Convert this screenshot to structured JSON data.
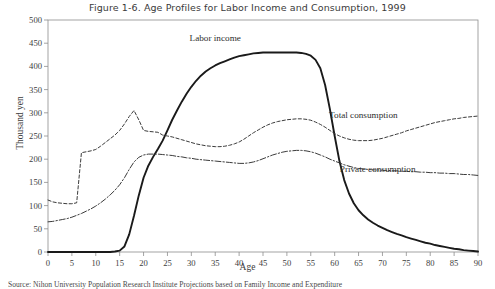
{
  "figure": {
    "title": "Figure 1-6. Age Profiles for Labor Income and Consumption, 1999",
    "source": "Source: Nihon University Population Research Institute Projections based on Family Income and Expenditure"
  },
  "chart_data": {
    "type": "line",
    "title": "Figure 1-6. Age Profiles for Labor Income and Consumption, 1999",
    "xlabel": "Age",
    "ylabel": "Thousand yen",
    "xlim": [
      0,
      90
    ],
    "ylim": [
      0,
      500
    ],
    "xticks": [
      0,
      5,
      10,
      15,
      20,
      25,
      30,
      35,
      40,
      45,
      50,
      55,
      60,
      65,
      70,
      75,
      80,
      85,
      90
    ],
    "yticks": [
      0,
      50,
      100,
      150,
      200,
      250,
      300,
      350,
      400,
      450,
      500
    ],
    "grid": false,
    "legend_position": "inline-annotations",
    "x": [
      0,
      1,
      2,
      3,
      4,
      5,
      6,
      7,
      8,
      9,
      10,
      11,
      12,
      13,
      14,
      15,
      16,
      17,
      18,
      19,
      20,
      21,
      22,
      23,
      24,
      25,
      26,
      27,
      28,
      29,
      30,
      31,
      32,
      33,
      34,
      35,
      36,
      37,
      38,
      39,
      40,
      41,
      42,
      43,
      44,
      45,
      46,
      47,
      48,
      49,
      50,
      51,
      52,
      53,
      54,
      55,
      56,
      57,
      58,
      59,
      60,
      61,
      62,
      63,
      64,
      65,
      66,
      67,
      68,
      69,
      70,
      71,
      72,
      73,
      74,
      75,
      76,
      77,
      78,
      79,
      80,
      81,
      82,
      83,
      84,
      85,
      86,
      87,
      88,
      89,
      90
    ],
    "series": [
      {
        "name": "Labor income",
        "style": "solid",
        "color": "#1a1a1a",
        "annotation": "Labor income",
        "annotation_x": 35,
        "annotation_y": 455,
        "values": [
          0,
          0,
          0,
          0,
          0,
          0,
          0,
          0,
          0,
          0,
          0,
          0,
          0,
          0,
          1,
          3,
          12,
          38,
          78,
          122,
          160,
          186,
          205,
          222,
          240,
          262,
          285,
          305,
          324,
          341,
          356,
          369,
          380,
          389,
          396,
          402,
          407,
          411,
          415,
          419,
          422,
          424,
          426,
          428,
          429,
          430,
          430,
          430,
          430,
          430,
          430,
          430,
          430,
          429,
          427,
          423,
          414,
          396,
          360,
          308,
          250,
          196,
          155,
          126,
          105,
          90,
          79,
          70,
          63,
          57,
          52,
          47,
          43,
          39,
          36,
          32,
          29,
          26,
          23,
          20,
          18,
          15,
          13,
          11,
          9,
          7,
          6,
          4,
          3,
          2,
          1
        ]
      },
      {
        "name": "Total consumption",
        "style": "dashed",
        "color": "#3b3b3b",
        "annotation": "Total consumption",
        "annotation_x": 66,
        "annotation_y": 289,
        "values": [
          112,
          108,
          106,
          105,
          104,
          104,
          106,
          214,
          216,
          218,
          221,
          228,
          236,
          244,
          252,
          262,
          276,
          292,
          305,
          285,
          262,
          260,
          259,
          258,
          252,
          250,
          248,
          245,
          242,
          239,
          236,
          233,
          231,
          229,
          228,
          227,
          227,
          228,
          230,
          233,
          237,
          243,
          250,
          257,
          263,
          269,
          274,
          278,
          281,
          283,
          285,
          286,
          287,
          287,
          286,
          284,
          280,
          275,
          269,
          262,
          255,
          250,
          246,
          243,
          241,
          240,
          240,
          240,
          241,
          243,
          245,
          248,
          251,
          254,
          257,
          261,
          264,
          267,
          270,
          273,
          276,
          279,
          281,
          283,
          285,
          287,
          288,
          290,
          291,
          292,
          293
        ]
      },
      {
        "name": "Private consumption",
        "style": "dashdot",
        "color": "#3b3b3b",
        "annotation": "Private consumption",
        "annotation_x": 69,
        "annotation_y": 172,
        "values": [
          65,
          66,
          68,
          70,
          72,
          75,
          79,
          83,
          88,
          93,
          99,
          106,
          114,
          123,
          133,
          145,
          160,
          178,
          194,
          204,
          209,
          211,
          211,
          211,
          210,
          209,
          208,
          206,
          205,
          203,
          202,
          200,
          199,
          198,
          197,
          196,
          195,
          194,
          193,
          192,
          191,
          191,
          192,
          194,
          197,
          201,
          205,
          209,
          212,
          215,
          217,
          218,
          219,
          219,
          218,
          216,
          213,
          209,
          205,
          200,
          196,
          192,
          188,
          185,
          182,
          180,
          179,
          178,
          177,
          177,
          176,
          176,
          175,
          175,
          174,
          174,
          173,
          173,
          172,
          172,
          171,
          171,
          170,
          170,
          169,
          169,
          168,
          167,
          167,
          166,
          165
        ]
      }
    ]
  }
}
